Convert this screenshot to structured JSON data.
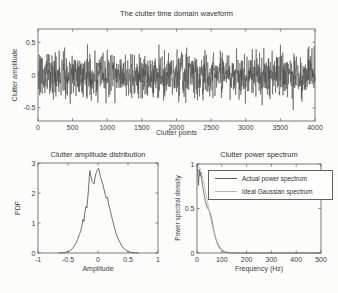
{
  "figure": {
    "background": "#fcfcfa",
    "ink": "#3c3c3c",
    "frame_color": "#5c5c5c"
  },
  "chart_data": [
    {
      "type": "line",
      "title": "The clutter time domain waveform",
      "xlabel": "Clutter points",
      "ylabel": "Clutter amplitude",
      "xlim": [
        0,
        4000
      ],
      "ylim": [
        -0.7,
        0.7
      ],
      "xticks": [
        0,
        500,
        1000,
        1500,
        2000,
        2500,
        3000,
        3500,
        4000
      ],
      "xtick_labels": [
        "0",
        "500",
        "1000",
        "1500",
        "2000",
        "2500",
        "3000",
        "3500",
        "4000"
      ],
      "yticks": [
        0.5,
        0,
        -0.5
      ],
      "ytick_labels": [
        "0.5",
        "0",
        "-0.5"
      ],
      "grid": false,
      "legend": null,
      "series": [
        {
          "name": "clutter waveform",
          "color": "#4a4a4a",
          "generator": {
            "kind": "gaussian-noise",
            "n": 1300,
            "std": 0.165,
            "clip": 0.56,
            "seed": 20
          }
        }
      ],
      "note": "dense random clutter signal, ~4000 samples, amplitude mostly within +/-0.5"
    },
    {
      "type": "line",
      "title": "Clutter amplitude distribution",
      "xlabel": "Amplitude",
      "ylabel": "PDF",
      "xlim": [
        -1,
        1
      ],
      "ylim": [
        0,
        3
      ],
      "xticks": [
        -1,
        -0.5,
        0,
        0.5,
        1
      ],
      "xtick_labels": [
        "-1",
        "-0.5",
        "0",
        "0.5",
        "1"
      ],
      "yticks": [
        0,
        1,
        2,
        3
      ],
      "ytick_labels": [
        "0",
        "1",
        "2",
        "3"
      ],
      "grid": false,
      "legend": null,
      "series": [
        {
          "name": "estimated PDF",
          "color": "#4a4a4a",
          "points": [
            [
              -0.66,
              0
            ],
            [
              -0.58,
              0.01
            ],
            [
              -0.52,
              0.03
            ],
            [
              -0.47,
              0.07
            ],
            [
              -0.43,
              0.14
            ],
            [
              -0.4,
              0.22
            ],
            [
              -0.37,
              0.32
            ],
            [
              -0.34,
              0.45
            ],
            [
              -0.31,
              0.62
            ],
            [
              -0.29,
              0.72
            ],
            [
              -0.27,
              0.88
            ],
            [
              -0.25,
              1.12
            ],
            [
              -0.235,
              1.05
            ],
            [
              -0.22,
              1.35
            ],
            [
              -0.2,
              1.55
            ],
            [
              -0.185,
              1.5
            ],
            [
              -0.17,
              1.85
            ],
            [
              -0.155,
              2.2
            ],
            [
              -0.145,
              2.55
            ],
            [
              -0.135,
              2.75
            ],
            [
              -0.125,
              2.6
            ],
            [
              -0.11,
              2.5
            ],
            [
              -0.095,
              2.35
            ],
            [
              -0.08,
              2.32
            ],
            [
              -0.065,
              2.3
            ],
            [
              -0.05,
              2.5
            ],
            [
              -0.035,
              2.65
            ],
            [
              -0.02,
              2.72
            ],
            [
              -0.005,
              2.78
            ],
            [
              0.01,
              2.82
            ],
            [
              0.025,
              2.7
            ],
            [
              0.04,
              2.55
            ],
            [
              0.06,
              2.42
            ],
            [
              0.08,
              2.3
            ],
            [
              0.1,
              2.12
            ],
            [
              0.12,
              1.95
            ],
            [
              0.14,
              1.82
            ],
            [
              0.16,
              1.86
            ],
            [
              0.18,
              1.6
            ],
            [
              0.2,
              1.45
            ],
            [
              0.22,
              1.28
            ],
            [
              0.245,
              1.08
            ],
            [
              0.27,
              0.88
            ],
            [
              0.3,
              0.66
            ],
            [
              0.33,
              0.5
            ],
            [
              0.36,
              0.37
            ],
            [
              0.39,
              0.26
            ],
            [
              0.42,
              0.17
            ],
            [
              0.46,
              0.1
            ],
            [
              0.5,
              0.05
            ],
            [
              0.55,
              0.02
            ],
            [
              0.61,
              0.005
            ],
            [
              0.68,
              0
            ]
          ]
        }
      ],
      "note": "bell-shaped amplitude histogram centered near 0, peak about 2.8"
    },
    {
      "type": "line",
      "title": "Clutter power spectrum",
      "xlabel": "Frequency (Hz)",
      "ylabel": "Power spectral density",
      "xlim": [
        0,
        500
      ],
      "ylim": [
        0,
        1
      ],
      "xticks": [
        0,
        100,
        200,
        300,
        400,
        500
      ],
      "xtick_labels": [
        "0",
        "100",
        "200",
        "300",
        "400",
        "500"
      ],
      "yticks": [
        0,
        0.5,
        1
      ],
      "ytick_labels": [
        "0",
        "0.5",
        "1"
      ],
      "grid": false,
      "legend": {
        "position": "upper right"
      },
      "series": [
        {
          "name": "Actual power spectrum",
          "color": "#5a5a5a",
          "points": [
            [
              0,
              1.0
            ],
            [
              4,
              0.85
            ],
            [
              6,
              0.76
            ],
            [
              9,
              0.94
            ],
            [
              12,
              0.86
            ],
            [
              15,
              0.91
            ],
            [
              18,
              0.84
            ],
            [
              22,
              0.77
            ],
            [
              26,
              0.7
            ],
            [
              30,
              0.64
            ],
            [
              34,
              0.58
            ],
            [
              38,
              0.54
            ],
            [
              42,
              0.51
            ],
            [
              46,
              0.49
            ],
            [
              50,
              0.47
            ],
            [
              54,
              0.44
            ],
            [
              58,
              0.4
            ],
            [
              62,
              0.34
            ],
            [
              66,
              0.28
            ],
            [
              70,
              0.23
            ],
            [
              74,
              0.18
            ],
            [
              78,
              0.14
            ],
            [
              83,
              0.1
            ],
            [
              88,
              0.07
            ],
            [
              93,
              0.048
            ],
            [
              98,
              0.032
            ],
            [
              104,
              0.02
            ],
            [
              110,
              0.012
            ],
            [
              117,
              0.007
            ],
            [
              125,
              0.004
            ],
            [
              135,
              0.002
            ],
            [
              150,
              0.0015
            ],
            [
              170,
              0.001
            ],
            [
              200,
              0.001
            ],
            [
              300,
              0.0008
            ],
            [
              500,
              0.0008
            ]
          ]
        },
        {
          "name": "Ideal Gaussian spectrum",
          "color": "#b4b4b4",
          "points": [
            [
              0,
              1.0
            ],
            [
              10,
              0.969
            ],
            [
              20,
              0.882
            ],
            [
              30,
              0.755
            ],
            [
              40,
              0.607
            ],
            [
              50,
              0.458
            ],
            [
              60,
              0.325
            ],
            [
              70,
              0.216
            ],
            [
              80,
              0.135
            ],
            [
              90,
              0.079
            ],
            [
              100,
              0.044
            ],
            [
              110,
              0.023
            ],
            [
              120,
              0.011
            ],
            [
              130,
              0.005
            ],
            [
              140,
              0.002
            ],
            [
              150,
              0.001
            ],
            [
              160,
              0.0005
            ],
            [
              180,
              0.0001
            ],
            [
              200,
              0
            ],
            [
              500,
              0
            ]
          ]
        }
      ],
      "note": "PSD peaks at 1 near 0 Hz and decays to ~0 by ~120 Hz; two overlapping curves"
    }
  ]
}
